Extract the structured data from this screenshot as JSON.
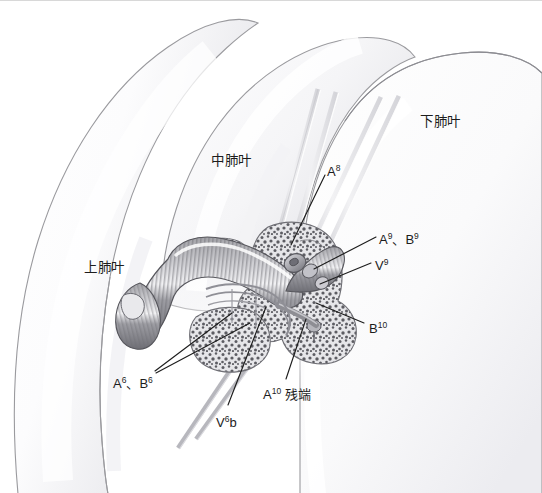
{
  "figure": {
    "kind": "surgical-anatomy-illustration",
    "width": 542,
    "height": 493,
    "background_color": "#ffffff",
    "ink_color": "#1d1d1d"
  },
  "labels": {
    "upper_lobe": {
      "text": "上肺叶",
      "x": 84,
      "y": 260
    },
    "middle_lobe": {
      "text": "中肺叶",
      "x": 211,
      "y": 153
    },
    "lower_lobe": {
      "text": "下肺叶",
      "x": 420,
      "y": 114
    },
    "a8": {
      "base": "A",
      "sup": "8",
      "x": 327,
      "y": 163
    },
    "a9_b9": {
      "base": "A",
      "sup": "9",
      "base2": "、B",
      "sup2": "9",
      "x": 379,
      "y": 231
    },
    "v9": {
      "base": "V",
      "sup": "9",
      "x": 375,
      "y": 257
    },
    "b10": {
      "base": "B",
      "sup": "10",
      "x": 369,
      "y": 320
    },
    "a6_b6": {
      "base": "A",
      "sup": "6",
      "base2": "、B",
      "sup2": "6",
      "x": 113,
      "y": 375
    },
    "a10_stump": {
      "base": "A",
      "sup": "10",
      "tail": " 残端",
      "x": 263,
      "y": 386
    },
    "v6b": {
      "base": "V",
      "sup": "6",
      "tail": "b",
      "x": 216,
      "y": 414
    }
  },
  "anatomy": {
    "lobes": [
      {
        "name": "upper-lobe",
        "fill": "#fbfbfc",
        "stroke": "#9a9a9e"
      },
      {
        "name": "middle-lobe",
        "fill": "#fbfbfc",
        "stroke": "#9a9a9e"
      },
      {
        "name": "lower-lobe",
        "fill": "#fbfbfc",
        "stroke": "#9a9a9e"
      }
    ],
    "bronchus": {
      "name": "bronchial-tree",
      "fill": "#8e8e92",
      "stroke": "#54545a",
      "ring_color": "#6d6d73"
    },
    "parenchyma": {
      "name": "stippled-parenchyma",
      "fill": "#e3e3e6",
      "stroke": "#6f6f75",
      "speckle": "#57575d"
    },
    "vessel_stumps": {
      "name": "vessel-stump",
      "fill": "#b9b9be",
      "stroke": "#5a5a60"
    },
    "instruments": {
      "name": "surgical-retractor-shaft",
      "fill": "#dcdce0",
      "stroke": "#c2c2c7",
      "count": 6
    }
  }
}
